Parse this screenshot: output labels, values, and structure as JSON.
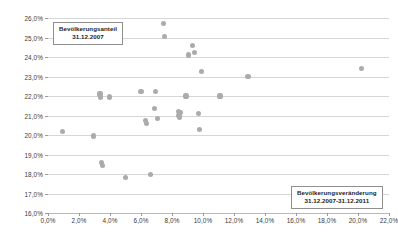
{
  "chart_data": {
    "type": "scatter",
    "title": "",
    "xlabel": "Bevölkerungsveränderung 31.12.2007-31.12.2011",
    "ylabel": "Bevölkerungsanteil 31.12.2007",
    "xlim": [
      0.0,
      22.0
    ],
    "ylim": [
      16.0,
      26.0
    ],
    "xticks": [
      "0,0%",
      "2,0%",
      "4,0%",
      "6,0%",
      "8,0%",
      "10,0%",
      "12,0%",
      "14,0%",
      "16,0%",
      "18,0%",
      "20,0%",
      "22,0%"
    ],
    "xtick_values": [
      0,
      2,
      4,
      6,
      8,
      10,
      12,
      14,
      16,
      18,
      20,
      22
    ],
    "yticks": [
      "16,0%",
      "17,0%",
      "18,0%",
      "19,0%",
      "20,0%",
      "21,0%",
      "22,0%",
      "23,0%",
      "24,0%",
      "25,0%",
      "26,0%"
    ],
    "ytick_values": [
      16,
      17,
      18,
      19,
      20,
      21,
      22,
      23,
      24,
      25,
      26
    ],
    "grid": "horizontal",
    "legend": "none",
    "marker_color": "#ababab",
    "points": [
      {
        "x": 0.95,
        "y": 20.2
      },
      {
        "x": 2.95,
        "y": 19.95
      },
      {
        "x": 3.35,
        "y": 22.1
      },
      {
        "x": 3.4,
        "y": 21.95
      },
      {
        "x": 3.45,
        "y": 18.6
      },
      {
        "x": 3.5,
        "y": 18.45
      },
      {
        "x": 3.95,
        "y": 21.95
      },
      {
        "x": 5.0,
        "y": 17.8
      },
      {
        "x": 6.0,
        "y": 22.25
      },
      {
        "x": 6.3,
        "y": 20.75
      },
      {
        "x": 6.35,
        "y": 20.6
      },
      {
        "x": 6.6,
        "y": 17.98
      },
      {
        "x": 6.85,
        "y": 21.35
      },
      {
        "x": 6.95,
        "y": 22.25
      },
      {
        "x": 7.05,
        "y": 20.85
      },
      {
        "x": 7.45,
        "y": 25.7
      },
      {
        "x": 7.5,
        "y": 25.05
      },
      {
        "x": 8.4,
        "y": 21.2
      },
      {
        "x": 8.45,
        "y": 21.0
      },
      {
        "x": 8.5,
        "y": 20.9
      },
      {
        "x": 8.55,
        "y": 21.15
      },
      {
        "x": 8.9,
        "y": 22.0
      },
      {
        "x": 9.05,
        "y": 24.1
      },
      {
        "x": 9.3,
        "y": 24.6
      },
      {
        "x": 9.45,
        "y": 24.25
      },
      {
        "x": 9.7,
        "y": 21.1
      },
      {
        "x": 9.75,
        "y": 20.3
      },
      {
        "x": 9.9,
        "y": 23.25
      },
      {
        "x": 11.1,
        "y": 22.0
      },
      {
        "x": 12.9,
        "y": 23.0
      },
      {
        "x": 20.2,
        "y": 23.4
      }
    ]
  },
  "annotations": {
    "y_axis_box": {
      "line1": "Bevölkerungsanteil",
      "line2": "31.12.2007"
    },
    "x_axis_box": {
      "line1": "Bevölkerungsveränderung",
      "line2": "31.12.2007-31.12.2011"
    }
  }
}
